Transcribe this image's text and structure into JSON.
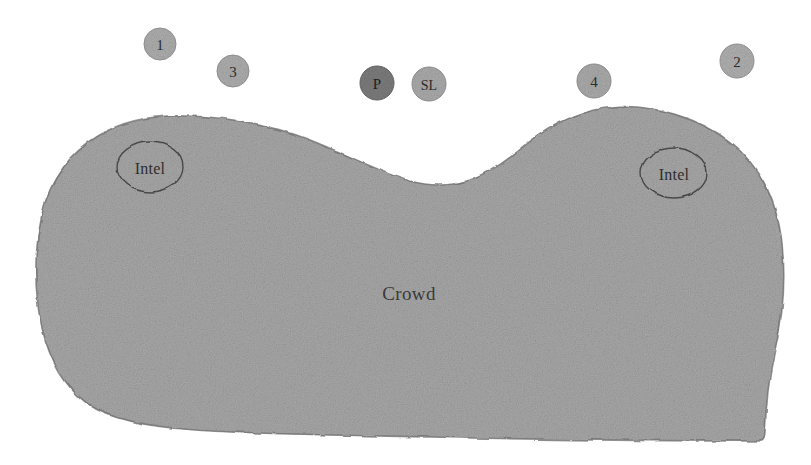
{
  "diagram": {
    "background_color": "#ffffff",
    "crowd": {
      "label": "Crowd",
      "fill_color": "#a8a8a8",
      "edge_color": "#6e6e6e",
      "label_color": "#3a3a3a",
      "label_x": 409,
      "label_y": 293
    },
    "intel_markers": [
      {
        "name": "intel-marker-left",
        "label": "Intel",
        "cx": 150,
        "cy": 167,
        "rx": 33,
        "ry": 25,
        "stroke_color": "#4a4a4a",
        "fill": "none"
      },
      {
        "name": "intel-marker-right",
        "label": "Intel",
        "cx": 674,
        "cy": 173,
        "rx": 33,
        "ry": 25,
        "stroke_color": "#4a4a4a",
        "fill": "none"
      }
    ],
    "unit_markers": [
      {
        "name": "unit-marker-1",
        "label": "1",
        "cx": 160,
        "cy": 44,
        "r": 16,
        "fill_color": "#aeaeae",
        "text_color": "#2b2b2b",
        "font_size": 15
      },
      {
        "name": "unit-marker-3",
        "label": "3",
        "cx": 233,
        "cy": 71,
        "r": 16,
        "fill_color": "#aeaeae",
        "text_color": "#2b2b2b",
        "font_size": 15
      },
      {
        "name": "unit-marker-p",
        "label": "P",
        "cx": 377,
        "cy": 83,
        "r": 17,
        "fill_color": "#7c7c7c",
        "text_color": "#1f1f1f",
        "font_size": 15
      },
      {
        "name": "unit-marker-sl",
        "label": "SL",
        "cx": 429,
        "cy": 84,
        "r": 17,
        "fill_color": "#ababab",
        "text_color": "#242424",
        "font_size": 14
      },
      {
        "name": "unit-marker-4",
        "label": "4",
        "cx": 594,
        "cy": 81,
        "r": 17,
        "fill_color": "#ababab",
        "text_color": "#2b2b2b",
        "font_size": 15
      },
      {
        "name": "unit-marker-2",
        "label": "2",
        "cx": 737,
        "cy": 61,
        "r": 17,
        "fill_color": "#b0b0b0",
        "text_color": "#2b2b2b",
        "font_size": 15
      }
    ]
  }
}
